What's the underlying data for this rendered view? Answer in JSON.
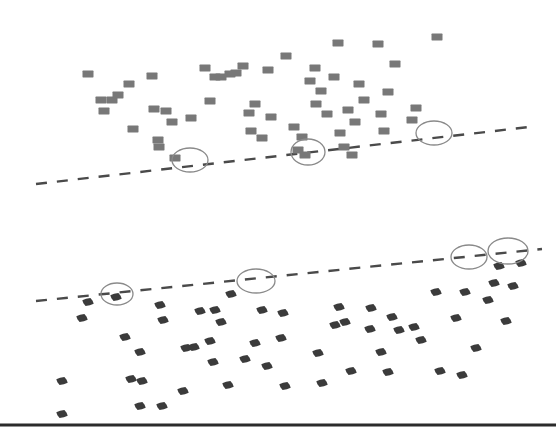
{
  "figure": {
    "width": 556,
    "height": 438,
    "background": "#ffffff",
    "description": "Two stacked scatter plots with dashed upper-boundary (envelope) trend lines and ellipse annotations highlighting boundary points"
  },
  "colors": {
    "square_marker": "#787878",
    "hex_marker": "#3b3b3b",
    "dashed_line": "#4a4a4a",
    "ellipse_stroke": "#8a8a8a",
    "baseline_rule": "#2b2b2b",
    "background": "#ffffff"
  },
  "chart_data": {
    "type": "scatter",
    "title": "",
    "subtitle": "",
    "xlabel": "",
    "ylabel": "",
    "grid": false,
    "legend": "none",
    "xlim": [
      0,
      556
    ],
    "ylim": [
      0,
      438
    ],
    "panels": [
      {
        "name": "top-panel",
        "marker": "square",
        "marker_color": "#787878",
        "marker_size": 11,
        "region": [
          0,
          0,
          556,
          200
        ],
        "points": [
          [
            88,
            74
          ],
          [
            101,
            100
          ],
          [
            104,
            111
          ],
          [
            112,
            100
          ],
          [
            118,
            95
          ],
          [
            129,
            84
          ],
          [
            133,
            129
          ],
          [
            152,
            76
          ],
          [
            154,
            109
          ],
          [
            158,
            140
          ],
          [
            159,
            147
          ],
          [
            166,
            111
          ],
          [
            172,
            122
          ],
          [
            175,
            158
          ],
          [
            191,
            118
          ],
          [
            205,
            68
          ],
          [
            210,
            101
          ],
          [
            215,
            77
          ],
          [
            221,
            77
          ],
          [
            230,
            74
          ],
          [
            236,
            73
          ],
          [
            243,
            66
          ],
          [
            249,
            113
          ],
          [
            251,
            131
          ],
          [
            255,
            104
          ],
          [
            262,
            138
          ],
          [
            268,
            70
          ],
          [
            271,
            117
          ],
          [
            286,
            56
          ],
          [
            294,
            127
          ],
          [
            298,
            150
          ],
          [
            302,
            137
          ],
          [
            305,
            155
          ],
          [
            310,
            81
          ],
          [
            315,
            68
          ],
          [
            316,
            104
          ],
          [
            321,
            91
          ],
          [
            327,
            114
          ],
          [
            334,
            77
          ],
          [
            338,
            43
          ],
          [
            340,
            133
          ],
          [
            344,
            147
          ],
          [
            348,
            110
          ],
          [
            352,
            155
          ],
          [
            355,
            122
          ],
          [
            359,
            84
          ],
          [
            364,
            100
          ],
          [
            378,
            44
          ],
          [
            381,
            114
          ],
          [
            384,
            131
          ],
          [
            388,
            92
          ],
          [
            395,
            64
          ],
          [
            412,
            120
          ],
          [
            416,
            108
          ],
          [
            437,
            37
          ]
        ],
        "trendline": {
          "style": "dashed",
          "x1": 36,
          "y1": 184,
          "x2": 529,
          "y2": 127
        },
        "annotations": [
          {
            "shape": "ellipse",
            "cx": 190,
            "cy": 160,
            "rx": 18,
            "ry": 12
          },
          {
            "shape": "ellipse",
            "cx": 308,
            "cy": 152,
            "rx": 17,
            "ry": 13
          },
          {
            "shape": "ellipse",
            "cx": 434,
            "cy": 133,
            "rx": 18,
            "ry": 12
          }
        ]
      },
      {
        "name": "bottom-panel",
        "marker": "hexagon",
        "marker_color": "#3b3b3b",
        "marker_size": 11,
        "region": [
          0,
          220,
          556,
          200
        ],
        "points": [
          [
            62,
            381
          ],
          [
            62,
            414
          ],
          [
            88,
            302
          ],
          [
            82,
            318
          ],
          [
            116,
            297
          ],
          [
            125,
            337
          ],
          [
            131,
            379
          ],
          [
            142,
            381
          ],
          [
            140,
            352
          ],
          [
            160,
            305
          ],
          [
            163,
            320
          ],
          [
            140,
            406
          ],
          [
            162,
            406
          ],
          [
            186,
            348
          ],
          [
            194,
            347
          ],
          [
            183,
            391
          ],
          [
            210,
            341
          ],
          [
            200,
            311
          ],
          [
            215,
            310
          ],
          [
            221,
            322
          ],
          [
            213,
            362
          ],
          [
            231,
            294
          ],
          [
            228,
            385
          ],
          [
            245,
            359
          ],
          [
            255,
            343
          ],
          [
            262,
            310
          ],
          [
            267,
            366
          ],
          [
            283,
            313
          ],
          [
            281,
            338
          ],
          [
            285,
            386
          ],
          [
            318,
            353
          ],
          [
            322,
            383
          ],
          [
            335,
            325
          ],
          [
            339,
            307
          ],
          [
            345,
            322
          ],
          [
            351,
            371
          ],
          [
            370,
            329
          ],
          [
            371,
            308
          ],
          [
            381,
            352
          ],
          [
            388,
            372
          ],
          [
            392,
            317
          ],
          [
            399,
            330
          ],
          [
            414,
            327
          ],
          [
            421,
            340
          ],
          [
            436,
            292
          ],
          [
            440,
            371
          ],
          [
            456,
            318
          ],
          [
            462,
            375
          ],
          [
            465,
            292
          ],
          [
            476,
            348
          ],
          [
            488,
            300
          ],
          [
            494,
            283
          ],
          [
            499,
            266
          ],
          [
            506,
            321
          ],
          [
            513,
            286
          ],
          [
            521,
            263
          ]
        ],
        "trendline": {
          "style": "dashed",
          "x1": 36,
          "y1": 301,
          "x2": 542,
          "y2": 249
        },
        "annotations": [
          {
            "shape": "ellipse",
            "cx": 117,
            "cy": 294,
            "rx": 16,
            "ry": 11
          },
          {
            "shape": "ellipse",
            "cx": 256,
            "cy": 281,
            "rx": 19,
            "ry": 12
          },
          {
            "shape": "ellipse",
            "cx": 469,
            "cy": 257,
            "rx": 18,
            "ry": 12
          },
          {
            "shape": "ellipse",
            "cx": 508,
            "cy": 251,
            "rx": 20,
            "ry": 13
          }
        ]
      }
    ],
    "baseline_rule": {
      "x1": 0,
      "y1": 425,
      "x2": 556,
      "y2": 425,
      "width": 3
    }
  }
}
